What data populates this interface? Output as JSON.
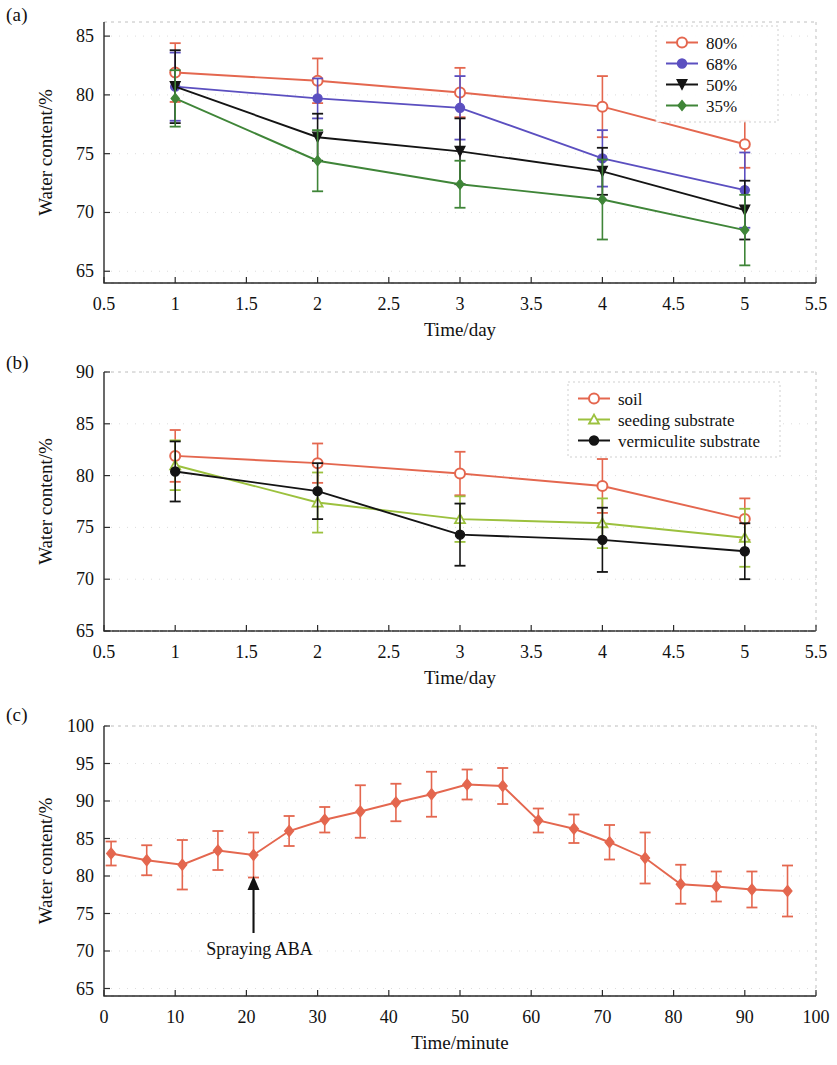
{
  "figure": {
    "panels": [
      {
        "tag": "(a)",
        "xlabel": "Time/day",
        "ylabel": "Water content/%"
      },
      {
        "tag": "(b)",
        "xlabel": "Time/day",
        "ylabel": "Water content/%"
      },
      {
        "tag": "(c)",
        "xlabel": "Time/minute",
        "ylabel": "Water content/%"
      }
    ]
  },
  "chart_data": [
    {
      "type": "line",
      "panel": "(a)",
      "title": "",
      "xlabel": "Time/day",
      "ylabel": "Water content/%",
      "x": [
        1,
        2,
        3,
        4,
        5
      ],
      "xlim": [
        0.5,
        5.5
      ],
      "ylim": [
        64.0,
        86.2
      ],
      "xticks": [
        0.5,
        1,
        1.5,
        2,
        2.5,
        3,
        3.5,
        4,
        4.5,
        5,
        5.5
      ],
      "xtick_labels": [
        "0.5",
        "1",
        "1.5",
        "2",
        "2.5",
        "3",
        "3.5",
        "4",
        "4.5",
        "5",
        "5.5"
      ],
      "yticks": [
        65,
        70,
        75,
        80,
        85
      ],
      "ytick_labels": [
        "65",
        "70",
        "75",
        "80",
        "85"
      ],
      "grid": true,
      "legend_position": "top-right",
      "errorbars": true,
      "series": [
        {
          "name": "80%",
          "color": "#e4674f",
          "marker": "open-circle",
          "values": [
            81.9,
            81.2,
            80.2,
            79.0,
            75.8
          ],
          "errors": [
            2.5,
            1.9,
            2.1,
            2.6,
            2.0
          ]
        },
        {
          "name": "68%",
          "color": "#5b4fc0",
          "marker": "filled-circle",
          "values": [
            80.7,
            79.7,
            78.9,
            74.6,
            71.9
          ],
          "errors": [
            2.9,
            1.7,
            2.7,
            2.4,
            3.2
          ]
        },
        {
          "name": "50%",
          "color": "#141414",
          "marker": "down-triangle",
          "values": [
            80.7,
            76.4,
            75.2,
            73.5,
            70.2
          ],
          "errors": [
            3.1,
            2.0,
            2.8,
            2.0,
            2.5
          ]
        },
        {
          "name": "35%",
          "color": "#3f8538",
          "marker": "filled-diamond",
          "values": [
            79.7,
            74.4,
            72.4,
            71.1,
            68.5
          ],
          "errors": [
            2.4,
            2.6,
            2.0,
            3.4,
            3.0
          ]
        }
      ]
    },
    {
      "type": "line",
      "panel": "(b)",
      "title": "",
      "xlabel": "Time/day",
      "ylabel": "Water content/%",
      "x": [
        1,
        2,
        3,
        4,
        5
      ],
      "xlim": [
        0.5,
        5.5
      ],
      "ylim": [
        65,
        90
      ],
      "xticks": [
        0.5,
        1,
        1.5,
        2,
        2.5,
        3,
        3.5,
        4,
        4.5,
        5,
        5.5
      ],
      "xtick_labels": [
        "0.5",
        "1",
        "1.5",
        "2",
        "2.5",
        "3",
        "3.5",
        "4",
        "4.5",
        "5",
        "5.5"
      ],
      "yticks": [
        65,
        70,
        75,
        80,
        85,
        90
      ],
      "ytick_labels": [
        "65",
        "70",
        "75",
        "80",
        "85",
        "90"
      ],
      "grid": true,
      "legend_position": "top-right",
      "errorbars": true,
      "series": [
        {
          "name": "soil",
          "color": "#e4674f",
          "marker": "open-circle",
          "values": [
            81.9,
            81.2,
            80.2,
            79.0,
            75.8
          ],
          "errors": [
            2.5,
            1.9,
            2.1,
            2.6,
            2.0
          ]
        },
        {
          "name": "seeding substrate",
          "color": "#9cc13e",
          "marker": "open-triangle",
          "values": [
            81.0,
            77.4,
            75.8,
            75.4,
            74.0
          ],
          "errors": [
            2.4,
            2.9,
            2.2,
            2.4,
            2.8
          ]
        },
        {
          "name": "vermiculite substrate",
          "color": "#141414",
          "marker": "filled-circle",
          "values": [
            80.4,
            78.5,
            74.3,
            73.8,
            72.7
          ],
          "errors": [
            2.9,
            2.7,
            3.0,
            3.1,
            2.7
          ]
        }
      ]
    },
    {
      "type": "line",
      "panel": "(c)",
      "title": "",
      "xlabel": "Time/minute",
      "ylabel": "Water content/%",
      "xlim": [
        0,
        100
      ],
      "ylim": [
        64.0,
        100
      ],
      "xticks": [
        0,
        10,
        20,
        30,
        40,
        50,
        60,
        70,
        80,
        90,
        100
      ],
      "xtick_labels": [
        "0",
        "10",
        "20",
        "30",
        "40",
        "50",
        "60",
        "70",
        "80",
        "90",
        "100"
      ],
      "yticks": [
        65,
        70,
        75,
        80,
        85,
        90,
        95,
        100
      ],
      "ytick_labels": [
        "65",
        "70",
        "75",
        "80",
        "85",
        "90",
        "95",
        "100"
      ],
      "grid": true,
      "legend_position": "none",
      "errorbars": true,
      "annotation": {
        "text": "Spraying ABA",
        "arrow_x": 21,
        "arrow_y_tail": 72.4,
        "arrow_y_head": 80.0
      },
      "series": [
        {
          "name": "water content",
          "color": "#e4674f",
          "marker": "filled-diamond",
          "x": [
            1,
            6,
            11,
            16,
            21,
            26,
            31,
            36,
            41,
            46,
            51,
            56,
            61,
            66,
            71,
            76,
            81,
            86,
            91,
            96
          ],
          "values": [
            83.0,
            82.1,
            81.5,
            83.4,
            82.8,
            86.0,
            87.5,
            88.6,
            89.8,
            90.9,
            92.2,
            92.0,
            87.4,
            86.3,
            84.5,
            82.4,
            78.9,
            78.6,
            78.2,
            78.0
          ],
          "errors": [
            1.6,
            2.0,
            3.3,
            2.6,
            3.0,
            2.0,
            1.7,
            3.5,
            2.5,
            3.0,
            2.0,
            2.4,
            1.6,
            1.9,
            2.3,
            3.4,
            2.6,
            2.0,
            2.4,
            3.4
          ]
        }
      ]
    }
  ]
}
